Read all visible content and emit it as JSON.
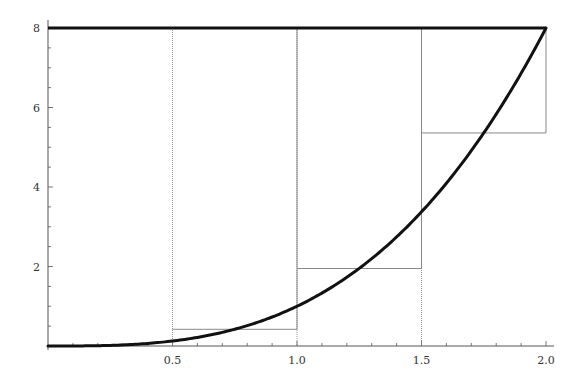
{
  "chart_data": {
    "type": "line",
    "title": "",
    "xlabel": "",
    "ylabel": "",
    "xlim": [
      0,
      2.0
    ],
    "ylim": [
      0,
      8
    ],
    "grid": false,
    "x_ticks": [
      0.5,
      1.0,
      1.5,
      2.0
    ],
    "x_tick_labels": [
      "0.5",
      "1.0",
      "1.5",
      "2.0"
    ],
    "y_ticks": [
      2,
      4,
      6,
      8
    ],
    "y_tick_labels": [
      "2",
      "4",
      "6",
      "8"
    ],
    "series": [
      {
        "name": "curve y = x^3",
        "function": "x^3",
        "x_range": [
          0,
          2
        ],
        "style": "thick-solid"
      },
      {
        "name": "horizontal line y = 8",
        "value": 8,
        "x_range": [
          0,
          2
        ],
        "style": "thick-solid"
      }
    ],
    "rectangles": [
      {
        "x0": 0.5,
        "x1": 1.0,
        "height": 0.42
      },
      {
        "x0": 1.0,
        "x1": 1.5,
        "height": 1.95
      },
      {
        "x0": 1.5,
        "x1": 2.0,
        "height": 5.36
      }
    ],
    "vertical_lines_from_top": [
      0.5,
      1.0,
      1.5,
      2.0
    ]
  },
  "colors": {
    "curve": "#111111",
    "rect": "#888888",
    "axis": "#555555"
  }
}
